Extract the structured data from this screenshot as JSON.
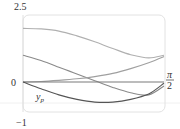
{
  "chart_data": {
    "type": "line",
    "title": "",
    "xlabel": "",
    "ylabel": "",
    "xlim": [
      0,
      1.5708
    ],
    "ylim": [
      -1,
      2.5
    ],
    "grid": false,
    "x_tick_labels": [
      "0",
      "π/2"
    ],
    "y_tick_labels": [
      "2.5",
      "0",
      "−1"
    ],
    "x": [
      0,
      0.2,
      0.4,
      0.6,
      0.8,
      1.0,
      1.2,
      1.4,
      1.5708
    ],
    "series": [
      {
        "name": "curve-1",
        "color": "#b0b0b0",
        "values": [
          2.0,
          1.98,
          1.9,
          1.72,
          1.5,
          1.25,
          1.02,
          0.9,
          1.0
        ]
      },
      {
        "name": "curve-2",
        "color": "#8a8a8a",
        "values": [
          1.0,
          0.8,
          0.55,
          0.3,
          0.05,
          -0.2,
          -0.4,
          -0.48,
          -0.15
        ]
      },
      {
        "name": "curve-3",
        "color": "#a0a0a0",
        "values": [
          0.0,
          0.02,
          0.06,
          0.12,
          0.2,
          0.32,
          0.5,
          0.72,
          0.95
        ]
      },
      {
        "name": "zero-line",
        "color": "#7a7a7a",
        "values": [
          0,
          0,
          0,
          0,
          0,
          0,
          0,
          0,
          0
        ]
      },
      {
        "name": "y_p",
        "color": "#555555",
        "values": [
          0.0,
          -0.25,
          -0.48,
          -0.65,
          -0.75,
          -0.75,
          -0.65,
          -0.45,
          -0.05
        ]
      }
    ],
    "annotations": [
      {
        "text": "y_p",
        "x": 0.25,
        "y": -0.35
      }
    ]
  },
  "labels": {
    "y_top": "2.5",
    "y_zero": "0",
    "y_bottom": "−1",
    "x_end_num": "π",
    "x_end_den": "2",
    "yp_main": "y",
    "yp_sub": "p"
  }
}
